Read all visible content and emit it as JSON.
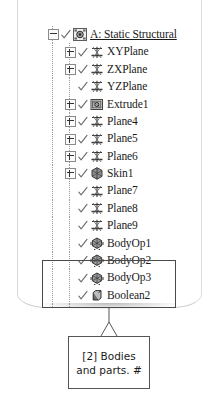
{
  "panel": {
    "name": "project-outline-tree"
  },
  "tree": {
    "items": [
      {
        "label": "A: Static Structural",
        "icon": "static-structural-icon",
        "indent": 0,
        "expander": "minus",
        "checked": true,
        "link": true
      },
      {
        "label": "XYPlane",
        "icon": "plane-icon",
        "indent": 1,
        "expander": "plus",
        "checked": true,
        "link": false
      },
      {
        "label": "ZXPlane",
        "icon": "plane-icon",
        "indent": 1,
        "expander": "plus",
        "checked": true,
        "link": false
      },
      {
        "label": "YZPlane",
        "icon": "plane-icon",
        "indent": 1,
        "expander": "none",
        "checked": true,
        "link": false
      },
      {
        "label": "Extrude1",
        "icon": "extrude-icon",
        "indent": 1,
        "expander": "plus",
        "checked": true,
        "link": false
      },
      {
        "label": "Plane4",
        "icon": "plane-icon",
        "indent": 1,
        "expander": "plus",
        "checked": true,
        "link": false
      },
      {
        "label": "Plane5",
        "icon": "plane-icon",
        "indent": 1,
        "expander": "plus",
        "checked": true,
        "link": false
      },
      {
        "label": "Plane6",
        "icon": "plane-icon",
        "indent": 1,
        "expander": "plus",
        "checked": true,
        "link": false
      },
      {
        "label": "Skin1",
        "icon": "skin-loft-icon",
        "indent": 1,
        "expander": "plus",
        "checked": true,
        "link": false
      },
      {
        "label": "Plane7",
        "icon": "plane-icon",
        "indent": 1,
        "expander": "none",
        "checked": true,
        "link": false
      },
      {
        "label": "Plane8",
        "icon": "plane-icon",
        "indent": 1,
        "expander": "none",
        "checked": true,
        "link": false
      },
      {
        "label": "Plane9",
        "icon": "plane-icon",
        "indent": 1,
        "expander": "none",
        "checked": true,
        "link": false
      },
      {
        "label": "BodyOp1",
        "icon": "body-operation-icon",
        "indent": 1,
        "expander": "none",
        "checked": true,
        "link": false
      },
      {
        "label": "BodyOp2",
        "icon": "body-operation-icon",
        "indent": 1,
        "expander": "none",
        "checked": true,
        "link": false
      },
      {
        "label": "BodyOp3",
        "icon": "body-operation-icon",
        "indent": 1,
        "expander": "none",
        "checked": true,
        "link": false
      },
      {
        "label": "Boolean2",
        "icon": "boolean-icon",
        "indent": 1,
        "expander": "none",
        "checked": true,
        "link": false
      },
      {
        "label": "SurfaceSk1",
        "icon": "surface-sketch-icon",
        "indent": 1,
        "expander": "plus",
        "checked": true,
        "link": false
      },
      {
        "label": "2 Parts, 2 Bodies",
        "icon": "parts-bodies-icon",
        "indent": 1,
        "expander": "minus",
        "checked": true,
        "link": false
      },
      {
        "label": "Fork",
        "icon": "solid-body-icon",
        "indent": 2,
        "expander": "none",
        "checked": true,
        "link": false
      },
      {
        "label": "Glass",
        "icon": "glass-body-icon",
        "indent": 2,
        "expander": "none",
        "checked": true,
        "link": false
      }
    ]
  },
  "highlight": {
    "name": "parts-bodies-highlight"
  },
  "callout": {
    "line1": "[2] Bodies",
    "line2": "and parts.  #"
  }
}
